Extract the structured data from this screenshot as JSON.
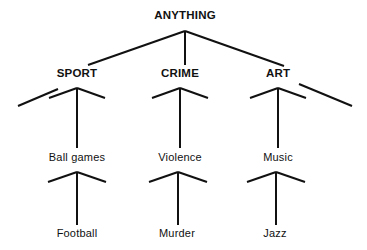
{
  "diagram": {
    "type": "hierarchy-tree",
    "title": "ANYTHING",
    "background_color": "#ffffff",
    "line_color": "#111111",
    "text_color": "#111111",
    "line_width": 2,
    "levels": [
      {
        "level": 0,
        "nodes": [
          {
            "id": "anything",
            "label": "ANYTHING",
            "x": 185,
            "y": 16
          }
        ]
      },
      {
        "level": 1,
        "nodes": [
          {
            "id": "sport",
            "label": "SPORT",
            "x": 77,
            "y": 74
          },
          {
            "id": "crime",
            "label": "CRIME",
            "x": 180,
            "y": 74
          },
          {
            "id": "art",
            "label": "ART",
            "x": 278,
            "y": 74
          }
        ]
      },
      {
        "level": 2,
        "nodes": [
          {
            "id": "ball-games",
            "label": "Ball games",
            "x": 77,
            "y": 157
          },
          {
            "id": "violence",
            "label": "Violence",
            "x": 180,
            "y": 157
          },
          {
            "id": "music",
            "label": "Music",
            "x": 278,
            "y": 157
          }
        ]
      },
      {
        "level": 3,
        "nodes": [
          {
            "id": "football",
            "label": "Football",
            "x": 77,
            "y": 233
          },
          {
            "id": "murder",
            "label": "Murder",
            "x": 177,
            "y": 233
          },
          {
            "id": "jazz",
            "label": "Jazz",
            "x": 275,
            "y": 233
          }
        ]
      }
    ],
    "edges": [
      {
        "id": "edge-anything-stem",
        "kind": "stem",
        "from": "anything",
        "x1": 185,
        "y1": 31,
        "x2": 185,
        "y2": 65
      },
      {
        "id": "edge-anything-left",
        "kind": "branch",
        "from": "anything",
        "to": "sport",
        "x1": 185,
        "y1": 31,
        "x2": 88,
        "y2": 65
      },
      {
        "id": "edge-anything-right",
        "kind": "branch",
        "from": "anything",
        "to": "art",
        "x1": 185,
        "y1": 31,
        "x2": 284,
        "y2": 66
      },
      {
        "id": "edge-sport-stub-left",
        "kind": "ellipsis-stub",
        "x1": 18,
        "y1": 106,
        "x2": 58,
        "y2": 89
      },
      {
        "id": "edge-art-stub-right",
        "kind": "ellipsis-stub",
        "x1": 299,
        "y1": 84,
        "x2": 352,
        "y2": 106
      },
      {
        "id": "edge-sport-left",
        "kind": "branch",
        "from": "sport",
        "x1": 77,
        "y1": 88,
        "x2": 49,
        "y2": 98
      },
      {
        "id": "edge-sport-right",
        "kind": "branch",
        "from": "sport",
        "x1": 77,
        "y1": 88,
        "x2": 105,
        "y2": 98
      },
      {
        "id": "edge-sport-stem",
        "kind": "stem",
        "from": "sport",
        "to": "ball-games",
        "x1": 77,
        "y1": 88,
        "x2": 77,
        "y2": 148
      },
      {
        "id": "edge-crime-left",
        "kind": "branch",
        "from": "crime",
        "x1": 180,
        "y1": 88,
        "x2": 152,
        "y2": 98
      },
      {
        "id": "edge-crime-right",
        "kind": "branch",
        "from": "crime",
        "x1": 180,
        "y1": 88,
        "x2": 208,
        "y2": 98
      },
      {
        "id": "edge-crime-stem",
        "kind": "stem",
        "from": "crime",
        "to": "violence",
        "x1": 180,
        "y1": 88,
        "x2": 180,
        "y2": 148
      },
      {
        "id": "edge-art-left",
        "kind": "branch",
        "from": "art",
        "x1": 278,
        "y1": 88,
        "x2": 250,
        "y2": 98
      },
      {
        "id": "edge-art-right",
        "kind": "branch",
        "from": "art",
        "x1": 278,
        "y1": 88,
        "x2": 306,
        "y2": 98
      },
      {
        "id": "edge-art-stem",
        "kind": "stem",
        "from": "art",
        "to": "music",
        "x1": 278,
        "y1": 88,
        "x2": 278,
        "y2": 148
      },
      {
        "id": "edge-ballgames-left",
        "kind": "branch",
        "from": "ball-games",
        "x1": 77,
        "y1": 172,
        "x2": 48,
        "y2": 182
      },
      {
        "id": "edge-ballgames-right",
        "kind": "branch",
        "from": "ball-games",
        "x1": 77,
        "y1": 172,
        "x2": 106,
        "y2": 182
      },
      {
        "id": "edge-ballgames-stem",
        "kind": "stem",
        "from": "ball-games",
        "to": "football",
        "x1": 77,
        "y1": 172,
        "x2": 77,
        "y2": 225
      },
      {
        "id": "edge-violence-left",
        "kind": "branch",
        "from": "violence",
        "x1": 178,
        "y1": 172,
        "x2": 149,
        "y2": 182
      },
      {
        "id": "edge-violence-right",
        "kind": "branch",
        "from": "violence",
        "x1": 178,
        "y1": 172,
        "x2": 207,
        "y2": 182
      },
      {
        "id": "edge-violence-stem",
        "kind": "stem",
        "from": "violence",
        "to": "murder",
        "x1": 178,
        "y1": 172,
        "x2": 178,
        "y2": 225
      },
      {
        "id": "edge-music-left",
        "kind": "branch",
        "from": "music",
        "x1": 276,
        "y1": 172,
        "x2": 247,
        "y2": 182
      },
      {
        "id": "edge-music-right",
        "kind": "branch",
        "from": "music",
        "x1": 276,
        "y1": 172,
        "x2": 305,
        "y2": 182
      },
      {
        "id": "edge-music-stem",
        "kind": "stem",
        "from": "music",
        "to": "jazz",
        "x1": 276,
        "y1": 172,
        "x2": 276,
        "y2": 225
      }
    ]
  }
}
